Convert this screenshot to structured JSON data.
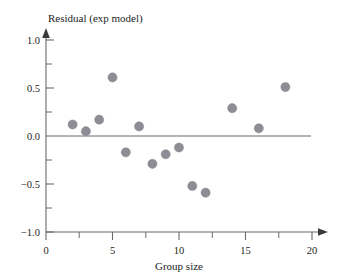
{
  "chart_data": {
    "type": "scatter",
    "title": "",
    "ylabel": "Residual (exp model)",
    "xlabel": "Group size",
    "xlim": [
      0,
      20
    ],
    "ylim": [
      -1.0,
      1.0
    ],
    "grid": false,
    "legend": "none",
    "reference_line": {
      "orientation": "horizontal",
      "value": 0.0
    },
    "x_ticks_major": [
      0,
      5,
      10,
      15,
      20
    ],
    "x_tick_labels": [
      "0",
      "5",
      "10",
      "15",
      "20"
    ],
    "x_ticks_minor": [
      2.5,
      7.5,
      12.5,
      17.5
    ],
    "y_ticks_major": [
      1.0,
      0.5,
      0.0,
      -0.5,
      -1.0
    ],
    "y_tick_labels": [
      "1.0",
      "0.5",
      "0.0",
      "−0.5",
      "−1.0"
    ],
    "y_ticks_minor": [
      0.75,
      0.25,
      -0.25,
      -0.75
    ],
    "marker": {
      "shape": "circle",
      "color": "#8d8d95",
      "size": 4.6
    },
    "x": [
      2,
      3,
      4,
      5,
      6,
      7,
      8,
      9,
      10,
      11,
      12,
      14,
      16,
      18
    ],
    "y": [
      0.12,
      0.05,
      0.17,
      0.61,
      -0.17,
      0.1,
      -0.29,
      -0.19,
      -0.12,
      -0.52,
      -0.59,
      0.29,
      0.08,
      0.51
    ],
    "points": [
      {
        "x": 2,
        "y": 0.12
      },
      {
        "x": 3,
        "y": 0.05
      },
      {
        "x": 4,
        "y": 0.17
      },
      {
        "x": 5,
        "y": 0.61
      },
      {
        "x": 6,
        "y": -0.17
      },
      {
        "x": 7,
        "y": 0.1
      },
      {
        "x": 8,
        "y": -0.29
      },
      {
        "x": 9,
        "y": -0.19
      },
      {
        "x": 10,
        "y": -0.12
      },
      {
        "x": 11,
        "y": -0.52
      },
      {
        "x": 12,
        "y": -0.59
      },
      {
        "x": 14,
        "y": 0.29
      },
      {
        "x": 16,
        "y": 0.08
      },
      {
        "x": 18,
        "y": 0.51
      }
    ]
  },
  "labels": {
    "y_axis_title": "Residual (exp model)",
    "x_axis_title": "Group size",
    "y1": "1.0",
    "y2": "0.5",
    "y3": "0.0",
    "y4": "−0.5",
    "y5": "−1.0",
    "x1": "0",
    "x2": "5",
    "x3": "10",
    "x4": "15",
    "x5": "20"
  },
  "colors": {
    "marker": "#8d8d95",
    "axis": "#6a6a6a",
    "text": "#1d1d1d",
    "background": "#ffffff"
  }
}
